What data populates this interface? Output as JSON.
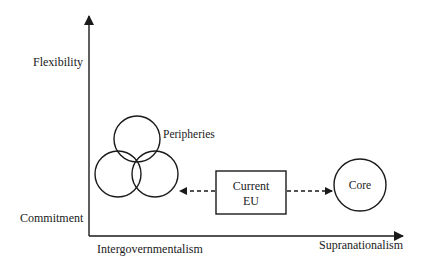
{
  "axes": {
    "y_axis": {
      "top_label": "Flexibility",
      "bottom_label": "Commitment"
    },
    "x_axis": {
      "left_label": "Intergovernmentalism",
      "right_label": "Supranationalism"
    }
  },
  "nodes": {
    "peripheries": {
      "label": "Peripheries",
      "shape": "three-overlapping-circles"
    },
    "current_eu": {
      "label_line1": "Current",
      "label_line2": "EU",
      "shape": "rectangle"
    },
    "core": {
      "label": "Core",
      "shape": "circle"
    }
  },
  "edges": [
    {
      "from": "current_eu",
      "to": "peripheries",
      "style": "dashed-arrow"
    },
    {
      "from": "current_eu",
      "to": "core",
      "style": "dashed-arrow"
    }
  ],
  "colors": {
    "stroke": "#1a1a1a",
    "background": "#ffffff"
  }
}
